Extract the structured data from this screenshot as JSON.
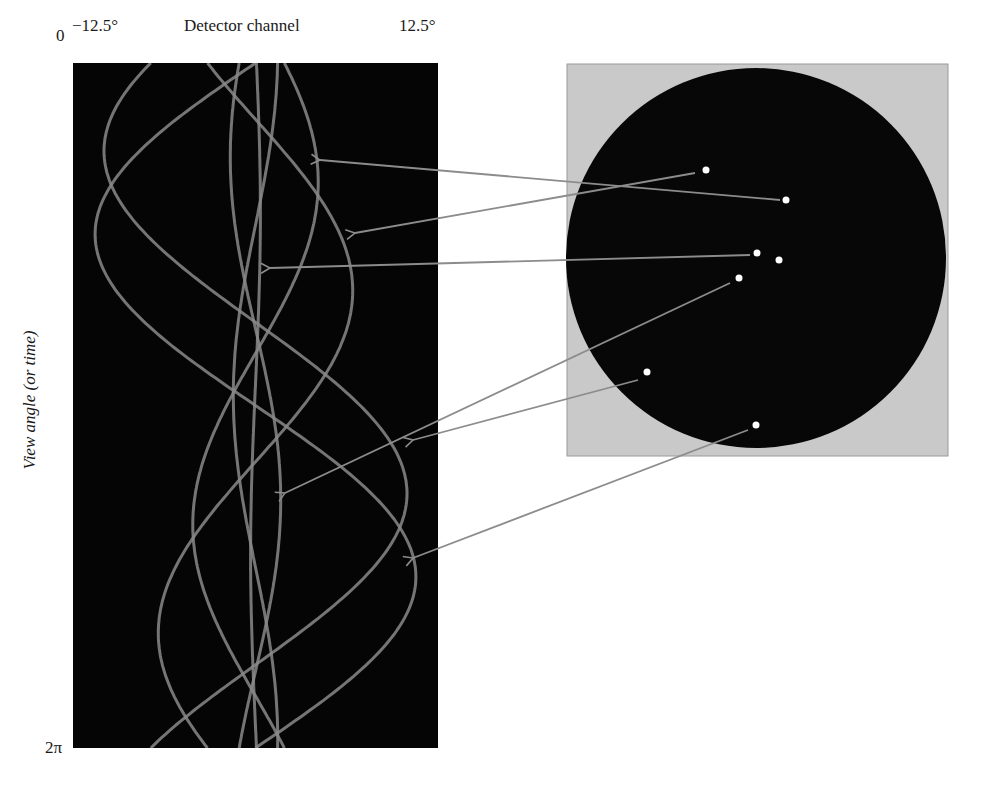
{
  "labels": {
    "x_min": "−12.5°",
    "x_title": "Detector channel",
    "x_max": "12.5°",
    "y_top": "0",
    "y_bottom": "2π",
    "y_title": "View angle (or time)"
  },
  "colors": {
    "sinogram_bg": "#050505",
    "curve": "#8a8a8a",
    "phantom_bg": "#c9c9c9",
    "phantom_disk": "#070707",
    "point": "#ffffff",
    "arrow": "#8c8c8c"
  },
  "chart_data": {
    "type": "diagram",
    "sinogram": {
      "xlabel": "Detector channel",
      "xlim_deg": [
        -12.5,
        12.5
      ],
      "ylabel": "View angle (or time)",
      "ylim": [
        "0",
        "2π"
      ],
      "rect": {
        "x": 73,
        "y": 63,
        "w": 365,
        "h": 685
      },
      "model": "x = cx + s*(dx*cos(theta) - dy*sin(theta)), theta in [0, 2pi]"
    },
    "phantom": {
      "square": {
        "x": 567,
        "y": 64,
        "w": 381,
        "h": 392
      },
      "disk": {
        "cx": 756,
        "cy": 258,
        "r": 190
      },
      "points": [
        {
          "id": "p1",
          "x": 706,
          "y": 170
        },
        {
          "id": "p2",
          "x": 786,
          "y": 200
        },
        {
          "id": "p3",
          "x": 757,
          "y": 253
        },
        {
          "id": "p4",
          "x": 779,
          "y": 260
        },
        {
          "id": "p5",
          "x": 739,
          "y": 278
        },
        {
          "id": "p6",
          "x": 647,
          "y": 372
        },
        {
          "id": "p7",
          "x": 756,
          "y": 425
        }
      ]
    },
    "arrows": [
      {
        "from": [
          780,
          200
        ],
        "to": [
          320,
          160
        ],
        "point": "p2"
      },
      {
        "from": [
          695,
          173
        ],
        "to": [
          355,
          233
        ],
        "point": "p1"
      },
      {
        "from": [
          750,
          255
        ],
        "to": [
          270,
          268
        ],
        "point": "p3"
      },
      {
        "from": [
          730,
          283
        ],
        "to": [
          285,
          493
        ],
        "point": "p5"
      },
      {
        "from": [
          638,
          380
        ],
        "to": [
          413,
          440
        ],
        "point": "p6"
      },
      {
        "from": [
          748,
          430
        ],
        "to": [
          413,
          558
        ],
        "point": "p7"
      }
    ]
  }
}
